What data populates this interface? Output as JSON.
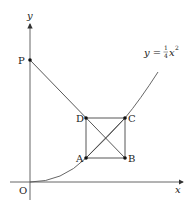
{
  "diagram": {
    "type": "geometry-graph",
    "axes": {
      "x_label": "x",
      "y_label": "y",
      "origin_label": "O"
    },
    "curve": {
      "equation_lhs": "y = ",
      "frac_num": "1",
      "frac_den": "4",
      "equation_var": "x",
      "equation_exp": "2"
    },
    "points": {
      "P": "P",
      "A": "A",
      "B": "B",
      "C": "C",
      "D": "D"
    }
  }
}
